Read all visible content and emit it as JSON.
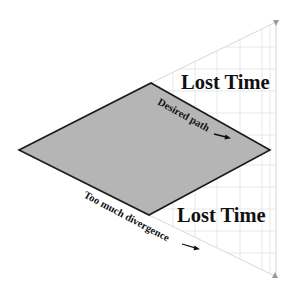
{
  "diagram": {
    "shape": {
      "type": "diamond",
      "vertices": {
        "left": [
          19,
          150
        ],
        "top": [
          151,
          83
        ],
        "right": [
          270,
          150
        ],
        "bottom": [
          149,
          215
        ]
      },
      "fill": "#b5b5b5",
      "stroke": "#1a1a1a"
    },
    "cone": {
      "upper_edge_to": [
        276,
        22
      ],
      "lower_edge_to": [
        275,
        276
      ],
      "grid_spacing": 22,
      "grid_color": "#e2e2e2"
    },
    "labels": {
      "lost_time_top": "Lost Time",
      "lost_time_bottom": "Lost Time",
      "desired_path": "Desired path",
      "too_much_divergence": "Too much divergence"
    },
    "icons": {
      "desired_path_arrow": "arrow-right",
      "divergence_arrow": "arrow-right",
      "top_marker": "triangle-down",
      "bottom_marker": "triangle-up"
    }
  }
}
